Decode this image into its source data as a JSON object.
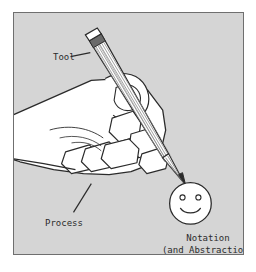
{
  "figure": {
    "background_color": "#d5d5d5",
    "page_color": "#ffffff",
    "border_color": "#6f6f6f",
    "ink_color": "#2b2b2b",
    "paper_fill": "#ffffff",
    "pencil_shading_color": "#8a8a8a"
  },
  "labels": {
    "tool": "Tool",
    "process": "Process",
    "notation": "Notation",
    "abstraction": "(and Abstraction)"
  },
  "icons": {
    "pencil": "pencil-icon",
    "hand": "hand-icon",
    "smiley": "smiley-face-icon",
    "tool_leader": "leader-line-icon",
    "process_leader": "leader-line-icon"
  }
}
